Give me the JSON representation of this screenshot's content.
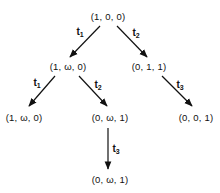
{
  "diagram": {
    "type": "coverability-tree",
    "nodes": [
      {
        "id": "n0",
        "label": "(1, 0, 0)",
        "x": 108,
        "y": 16
      },
      {
        "id": "n1",
        "label": "(1, ω, 0)",
        "x": 68,
        "y": 66
      },
      {
        "id": "n2",
        "label": "(0, 1, 1)",
        "x": 149,
        "y": 66
      },
      {
        "id": "n3",
        "label": "(1, ω, 0)",
        "x": 24,
        "y": 117
      },
      {
        "id": "n4",
        "label": "(0, ω, 1)",
        "x": 110,
        "y": 117
      },
      {
        "id": "n5",
        "label": "(0, 0, 1)",
        "x": 196,
        "y": 117
      },
      {
        "id": "n6",
        "label": "(0, ω, 1)",
        "x": 110,
        "y": 179
      }
    ],
    "edges": [
      {
        "from": "n0",
        "to": "n1",
        "label": "t",
        "sub": "1",
        "x1": 100,
        "y1": 26,
        "x2": 70,
        "y2": 57,
        "lx": 80,
        "ly": 32
      },
      {
        "from": "n0",
        "to": "n2",
        "label": "t",
        "sub": "2",
        "x1": 117,
        "y1": 26,
        "x2": 147,
        "y2": 57,
        "lx": 136,
        "ly": 33
      },
      {
        "from": "n1",
        "to": "n3",
        "label": "t",
        "sub": "1",
        "x1": 55,
        "y1": 76,
        "x2": 29,
        "y2": 106,
        "lx": 37,
        "ly": 83
      },
      {
        "from": "n1",
        "to": "n4",
        "label": "t",
        "sub": "2",
        "x1": 79,
        "y1": 76,
        "x2": 107,
        "y2": 106,
        "lx": 98,
        "ly": 85
      },
      {
        "from": "n2",
        "to": "n5",
        "label": "t",
        "sub": "3",
        "x1": 162,
        "y1": 76,
        "x2": 192,
        "y2": 106,
        "lx": 180,
        "ly": 85
      },
      {
        "from": "n4",
        "to": "n6",
        "label": "t",
        "sub": "3",
        "x1": 108,
        "y1": 128,
        "x2": 108,
        "y2": 169,
        "lx": 116,
        "ly": 149
      }
    ]
  }
}
